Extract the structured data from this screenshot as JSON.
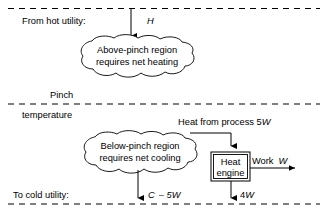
{
  "diagram": {
    "lines": {
      "hot_utility_label": "From hot utility:",
      "pinch_label_top": "Pinch",
      "pinch_label_bottom": "temperature",
      "cold_utility_label": "To cold utility:"
    },
    "above_region": {
      "text_line1": "Above-pinch region",
      "text_line2": "requires net heating"
    },
    "below_region": {
      "text_line1": "Below-pinch region",
      "text_line2": "requires net cooling"
    },
    "heat_engine": {
      "text_line1": "Heat",
      "text_line2": "engine"
    },
    "flows": {
      "hot_utility_duty": "H",
      "heat_from_process_prefix": "Heat from process 5",
      "heat_from_process_var": "W",
      "work_prefix": "Work",
      "work_var": "W",
      "cold_utility_value_prefix": "C",
      "cold_utility_value_operator": "– 5",
      "cold_utility_value_var": "W",
      "engine_reject_value": "4",
      "engine_reject_var": "W"
    },
    "colors": {
      "stroke": "#000000",
      "background": "#ffffff",
      "text": "#000000"
    },
    "icons": {
      "arrow_down": "arrow-down-icon",
      "arrow_right": "arrow-right-icon"
    }
  }
}
